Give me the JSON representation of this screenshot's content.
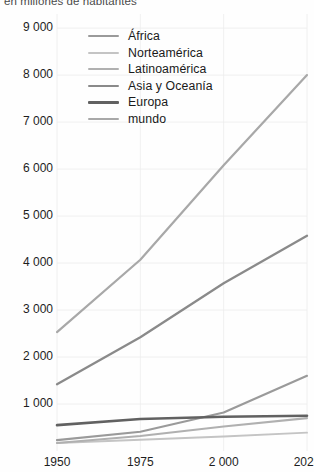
{
  "figure": {
    "subtitle": "en millones de habitantes",
    "background": "#fefefe"
  },
  "legend": {
    "position": "top-center-left",
    "items": [
      {
        "label": "África",
        "color": "#9a9a9a",
        "width": 2.2
      },
      {
        "label": "Norteamérica",
        "color": "#c4c4c4",
        "width": 1.9
      },
      {
        "label": "Latinoamérica",
        "color": "#b0b0b0",
        "width": 2.1
      },
      {
        "label": "Asia y Oceanía",
        "color": "#8a8a8a",
        "width": 2.3
      },
      {
        "label": "Europa",
        "color": "#616161",
        "width": 2.6
      },
      {
        "label": "mundo",
        "color": "#a8a8a8",
        "width": 2.2
      }
    ]
  },
  "axes": {
    "y_ticks": [
      "9 000",
      "8 000",
      "7 000",
      "6 000",
      "5 000",
      "4 000",
      "3 000",
      "2 000",
      "1 000"
    ],
    "y_tick_values": [
      9000,
      8000,
      7000,
      6000,
      5000,
      4000,
      3000,
      2000,
      1000
    ],
    "x_ticks": [
      "1950",
      "1975",
      "2 000",
      "2025"
    ],
    "x_tick_values": [
      1950,
      1975,
      2000,
      2025
    ],
    "grid": true,
    "grid_color": "#ececec",
    "tick_color": "#1d1d1d"
  },
  "chart_data": {
    "type": "line",
    "title": "",
    "subtitle": "en millones de habitantes",
    "xlabel": "",
    "ylabel": "",
    "xlim": [
      1950,
      2025
    ],
    "ylim": [
      0,
      9300
    ],
    "x": [
      1950,
      1975,
      2000,
      2025
    ],
    "grid": true,
    "legend_position": "upper left",
    "series": [
      {
        "name": "África",
        "color": "#9a9a9a",
        "values": [
          230,
          410,
          820,
          1600
        ]
      },
      {
        "name": "Norteamérica",
        "color": "#c4c4c4",
        "values": [
          170,
          240,
          310,
          390
        ]
      },
      {
        "name": "Latinoamérica",
        "color": "#b0b0b0",
        "values": [
          170,
          320,
          520,
          700
        ]
      },
      {
        "name": "Asia y Oceanía",
        "color": "#8a8a8a",
        "values": [
          1420,
          2420,
          3570,
          4580
        ]
      },
      {
        "name": "Europa",
        "color": "#616161",
        "values": [
          550,
          680,
          730,
          750
        ]
      },
      {
        "name": "mundo",
        "color": "#a8a8a8",
        "values": [
          2530,
          4070,
          6080,
          8000
        ]
      }
    ]
  }
}
